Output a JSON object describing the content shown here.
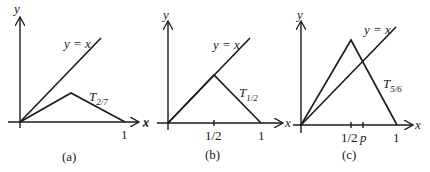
{
  "figure": {
    "panels": [
      {
        "id": "a",
        "caption": "(a)",
        "axis_x_label": "x",
        "axis_y_label": "y",
        "diagonal_label": "y = x",
        "tent_label_main": "T",
        "tent_label_sub": "2/7",
        "tent_parameter": 0.2857,
        "ticks": [
          {
            "value": 1,
            "label": "1"
          }
        ]
      },
      {
        "id": "b",
        "caption": "(b)",
        "axis_x_label": "x",
        "axis_x_label_left": "x",
        "axis_y_label": "y",
        "diagonal_label": "y = x",
        "tent_label_main": "T",
        "tent_label_sub": "1/2",
        "tent_parameter": 0.5,
        "ticks": [
          {
            "value": 0.5,
            "label": "1/2"
          },
          {
            "value": 1,
            "label": "1"
          }
        ]
      },
      {
        "id": "c",
        "caption": "(c)",
        "axis_x_label": "x",
        "axis_y_label": "y",
        "diagonal_label": "y = x",
        "tent_label_main": "T",
        "tent_label_sub": "5/6",
        "tent_parameter": 0.8333,
        "ticks": [
          {
            "value": 0.5,
            "label": "1/2"
          },
          {
            "value": 0.6,
            "label": "p"
          },
          {
            "value": 1,
            "label": "1"
          }
        ]
      }
    ]
  }
}
